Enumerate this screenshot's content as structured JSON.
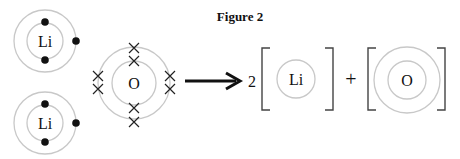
{
  "figure": {
    "title": "Figure 2"
  },
  "reactants": {
    "lithium_atoms": [
      {
        "symbol": "Li",
        "electrons_inner": 2,
        "electrons_outer": 1
      },
      {
        "symbol": "Li",
        "electrons_inner": 2,
        "electrons_outer": 1
      }
    ],
    "oxygen_atom": {
      "symbol": "O",
      "electrons_inner": 2,
      "electrons_outer": 6,
      "electron_marker": "cross"
    }
  },
  "equation": {
    "arrow": "right-arrow",
    "coefficient": "2",
    "plus": "+"
  },
  "products": {
    "lithium_ion": {
      "symbol": "Li"
    },
    "oxide_ion": {
      "symbol": "O"
    }
  }
}
